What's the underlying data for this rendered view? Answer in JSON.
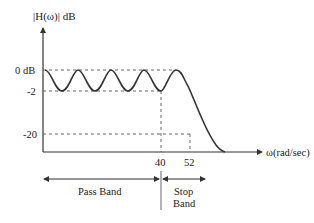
{
  "diagram": {
    "type": "lowpass-filter-magnitude-response",
    "y_axis": {
      "label": "|H(ω)|  dB",
      "ticks": [
        {
          "label": "0 dB",
          "value": 0
        },
        {
          "label": "-2",
          "value": -2
        },
        {
          "label": "-20",
          "value": -20
        }
      ]
    },
    "x_axis": {
      "label": "ω(rad/sec)",
      "ticks": [
        {
          "label": "40",
          "value": 40
        },
        {
          "label": "52",
          "value": 52
        }
      ]
    },
    "bands": {
      "pass": {
        "label": "Pass Band"
      },
      "stop": {
        "label_line1": "Stop",
        "label_line2": "Band"
      }
    },
    "colors": {
      "stroke": "#333333",
      "dashed": "#555555",
      "text": "#222222"
    }
  }
}
